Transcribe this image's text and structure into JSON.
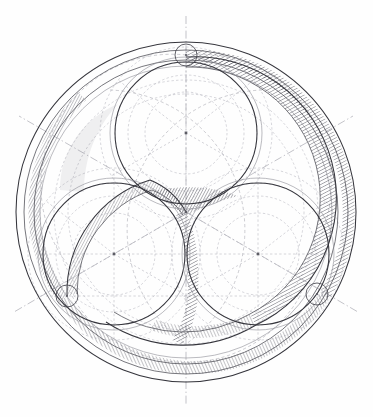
{
  "figure": {
    "kind": "technical-line-drawing",
    "medium": "pencil and ink on paper",
    "canvas": {
      "width": 373,
      "height": 417,
      "background": "#fefefe"
    },
    "palette": {
      "ink_dark": "#35353c",
      "ink_mid": "#4a4a52",
      "ink_faint": "#8d8d96",
      "construction_dashed": "#a9a9b2",
      "hatch": "#55555e",
      "paper": "#fefefe"
    },
    "geometry": {
      "center": {
        "x": 186,
        "y": 212
      },
      "outer_circle_radius": 170,
      "outer_rings": [
        {
          "name": "outermost",
          "radius": 170
        },
        {
          "name": "outer-band-outer-edge",
          "radius": 162
        },
        {
          "name": "outer-band-inner-edge",
          "radius": 152
        },
        {
          "name": "inner-guide",
          "radius": 146
        }
      ],
      "lobe_radius": 71,
      "lobe_centers": [
        {
          "name": "top-lobe",
          "x": 186,
          "y": 133,
          "angle_deg": -90
        },
        {
          "name": "left-lobe",
          "x": 114,
          "y": 254,
          "angle_deg": 150
        },
        {
          "name": "right-lobe",
          "x": 258,
          "y": 254,
          "angle_deg": 30
        }
      ],
      "node_circles": [
        {
          "name": "top-node",
          "x": 186,
          "y": 55,
          "radius": 11
        },
        {
          "name": "lower-left-node",
          "x": 67,
          "y": 296,
          "radius": 11
        },
        {
          "name": "lower-right-node",
          "x": 317,
          "y": 294,
          "radius": 11
        }
      ],
      "construction_radii_dashed": [
        41,
        58,
        71,
        86,
        100,
        118,
        132
      ],
      "axis_lines": [
        {
          "name": "vertical-centerline",
          "angle_deg": 90
        },
        {
          "name": "axis-30",
          "angle_deg": 30
        },
        {
          "name": "axis-150",
          "angle_deg": 150
        }
      ],
      "band_width": 10,
      "hatch_angle_deg": 62,
      "hatch_spacing_px": 2.6
    },
    "elements": [
      {
        "name": "outer-ring-band",
        "description": "hatched annular band following outer circle"
      },
      {
        "name": "trefoil-spiral-band",
        "description": "hatched band sweeping between three lobes"
      },
      {
        "name": "lobe-circles",
        "description": "three tangent circles arranged at 120 degrees"
      },
      {
        "name": "construction-arcs",
        "description": "dashed arcs radiating from lobe centers"
      },
      {
        "name": "center-junction",
        "description": "curved triangular node where three bands meet"
      }
    ]
  }
}
